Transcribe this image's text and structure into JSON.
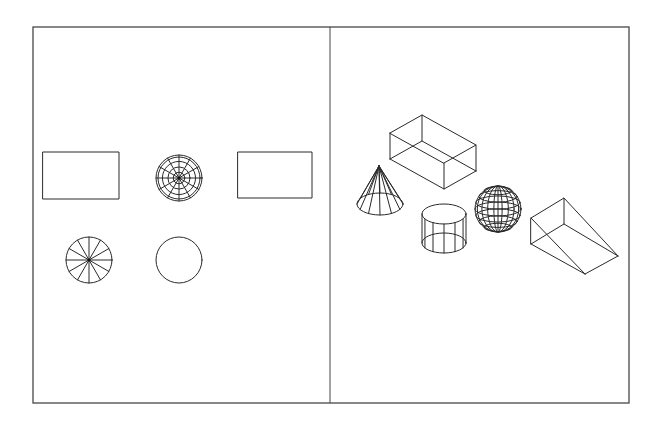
{
  "figure": {
    "colors": {
      "line": "#2a2a2a",
      "frame": "#555555",
      "background": "#ffffff"
    },
    "frame": {
      "x": 33,
      "y": 27,
      "width": 596,
      "height": 376,
      "divider_x": 330
    },
    "left_panel": {
      "name": "plan-views",
      "shapes": [
        {
          "id": "box-top-view",
          "type": "rect",
          "x": 43,
          "y": 152,
          "w": 76,
          "h": 47
        },
        {
          "id": "sphere-top-view",
          "type": "dartboard",
          "cx": 179,
          "cy": 178,
          "r": 23,
          "rings": 4,
          "spokes": 12
        },
        {
          "id": "wedge-top-view",
          "type": "rect",
          "x": 238,
          "y": 152,
          "w": 74,
          "h": 46
        },
        {
          "id": "cone-top-view",
          "type": "wheel",
          "cx": 89,
          "cy": 260,
          "r": 23,
          "spokes": 12
        },
        {
          "id": "cylinder-top-view",
          "type": "circle",
          "cx": 179,
          "cy": 260,
          "r": 23
        }
      ]
    },
    "right_panel": {
      "name": "isometric-views",
      "shapes": [
        {
          "id": "box-iso",
          "type": "box"
        },
        {
          "id": "cone-iso",
          "type": "cone"
        },
        {
          "id": "cylinder-iso",
          "type": "cylinder"
        },
        {
          "id": "sphere-iso",
          "type": "sphere"
        },
        {
          "id": "wedge-iso",
          "type": "wedge"
        }
      ]
    }
  }
}
